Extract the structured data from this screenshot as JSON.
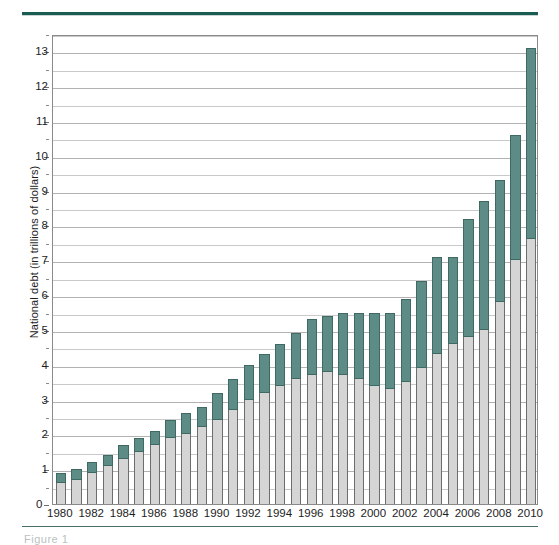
{
  "figure": {
    "caption": "Figure 1",
    "top_rule_color": "#1a5c52"
  },
  "chart_data": {
    "type": "bar",
    "title": "",
    "subtitle": "",
    "xlabel": "",
    "ylabel": "National debt (in trillions of dollars)",
    "ylim": [
      0,
      13.5
    ],
    "ytick_step": 1,
    "gridline_step": 0.5,
    "grid": true,
    "legend_position": "none",
    "stacked": true,
    "bar_colors": {
      "lower_segment": "#d5d5d5",
      "upper_segment": "#5d8c86",
      "outline": "#6d6d6d"
    },
    "yticks": [
      0,
      1,
      2,
      3,
      4,
      5,
      6,
      7,
      8,
      9,
      10,
      11,
      12,
      13
    ],
    "ytick_labels": [
      "0",
      "1",
      "2",
      "3",
      "4",
      "5",
      "6",
      "7",
      "8",
      "9",
      "10",
      "11",
      "12",
      "13"
    ],
    "categories": [
      "1980",
      "1981",
      "1982",
      "1983",
      "1984",
      "1985",
      "1986",
      "1987",
      "1988",
      "1989",
      "1990",
      "1991",
      "1992",
      "1993",
      "1994",
      "1995",
      "1996",
      "1997",
      "1998",
      "1999",
      "2000",
      "2001",
      "2002",
      "2003",
      "2004",
      "2005",
      "2006",
      "2007",
      "2008",
      "2009",
      "2010"
    ],
    "xtick_labels": [
      "1980",
      "1982",
      "1984",
      "1986",
      "1988",
      "1990",
      "1992",
      "1994",
      "1996",
      "1998",
      "2000",
      "2002",
      "2004",
      "2006",
      "2008",
      "2010"
    ],
    "series": [
      {
        "name": "Debt held by the public",
        "color": "#d5d5d5",
        "values": [
          0.6,
          0.7,
          0.9,
          1.1,
          1.3,
          1.5,
          1.7,
          1.9,
          2.0,
          2.2,
          2.4,
          2.7,
          3.0,
          3.2,
          3.4,
          3.6,
          3.7,
          3.8,
          3.7,
          3.6,
          3.4,
          3.3,
          3.5,
          3.9,
          4.3,
          4.6,
          4.8,
          5.0,
          5.8,
          7.0,
          7.6
        ]
      },
      {
        "name": "Intragovernmental holdings",
        "color": "#5d8c86",
        "values": [
          0.3,
          0.3,
          0.3,
          0.3,
          0.4,
          0.4,
          0.4,
          0.5,
          0.6,
          0.6,
          0.8,
          0.9,
          1.0,
          1.1,
          1.2,
          1.3,
          1.6,
          1.6,
          1.8,
          1.9,
          2.1,
          2.2,
          2.4,
          2.5,
          2.8,
          2.5,
          3.4,
          3.7,
          3.5,
          3.6,
          5.5
        ]
      }
    ],
    "totals": [
      0.9,
      1.0,
      1.2,
      1.4,
      1.7,
      1.9,
      2.1,
      2.4,
      2.6,
      2.8,
      3.2,
      3.6,
      4.0,
      4.3,
      4.6,
      4.9,
      5.3,
      5.4,
      5.5,
      5.5,
      5.5,
      5.5,
      5.9,
      6.4,
      7.1,
      7.1,
      8.2,
      8.7,
      9.3,
      10.6,
      13.1
    ]
  }
}
